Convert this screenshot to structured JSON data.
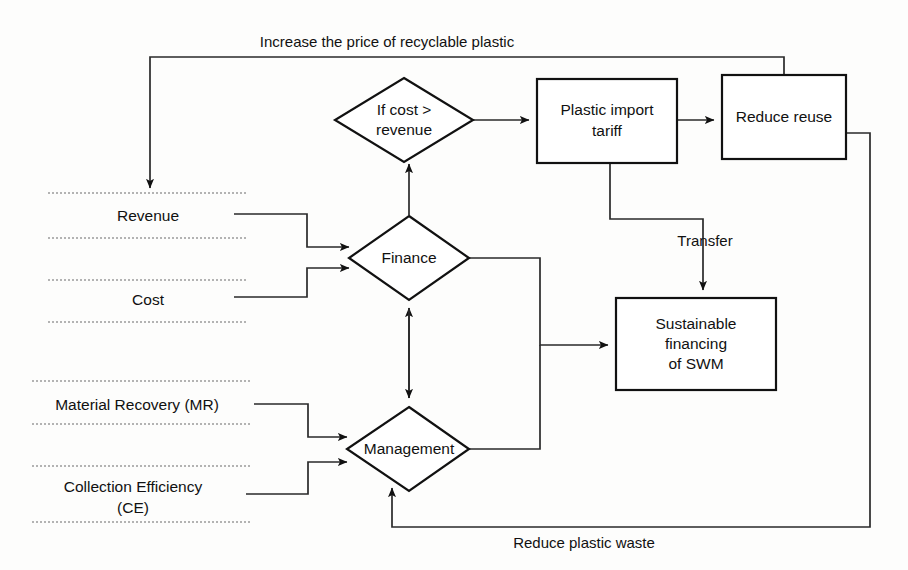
{
  "diagram": {
    "nodes": {
      "if_cost_revenue": {
        "label_line1": "If cost >",
        "label_line2": "revenue",
        "shape": "diamond"
      },
      "plastic_import_tariff": {
        "label_line1": "Plastic import",
        "label_line2": "tariff",
        "shape": "rectangle"
      },
      "reduce_reuse": {
        "label_line1": "Reduce reuse",
        "shape": "rectangle"
      },
      "finance": {
        "label_line1": "Finance",
        "shape": "diamond"
      },
      "management": {
        "label_line1": "Management",
        "shape": "diamond"
      },
      "sustainable_financing": {
        "label_line1": "Sustainable",
        "label_line2": "financing",
        "label_line3": "of SWM",
        "shape": "rectangle"
      }
    },
    "variables": [
      {
        "name": "revenue",
        "label_line1": "Revenue"
      },
      {
        "name": "cost",
        "label_line1": "Cost"
      },
      {
        "name": "material_recovery",
        "label_line1": "Material Recovery (MR)"
      },
      {
        "name": "collection_efficiency",
        "label_line1": "Collection Efficiency",
        "label_line2": "(CE)"
      }
    ],
    "edge_labels": {
      "top_feedback": "Increase the price of recyclable plastic",
      "tariff_to_financing": "Transfer",
      "bottom_feedback": "Reduce plastic waste"
    },
    "colors": {
      "stroke": "#111111",
      "connector": "#2a2a2a",
      "dotted": "#9a9a9a",
      "background": "#fdfdfc",
      "text": "#111111"
    }
  }
}
